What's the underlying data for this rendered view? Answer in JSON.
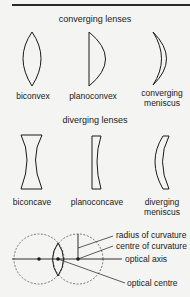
{
  "converging": {
    "heading": "converging lenses",
    "items": [
      {
        "label": "biconvex"
      },
      {
        "label": "planoconvex"
      },
      {
        "label": "converging",
        "label2": "meniscus"
      }
    ]
  },
  "diverging": {
    "heading": "diverging lenses",
    "items": [
      {
        "label": "biconcave"
      },
      {
        "label": "planoconcave"
      },
      {
        "label": "diverging",
        "label2": "meniscus"
      }
    ]
  },
  "construction": {
    "labels": {
      "radius": "radius of curvature",
      "centre": "centre of curvature",
      "axis": "optical axis",
      "optical_centre": "optical centre"
    }
  }
}
